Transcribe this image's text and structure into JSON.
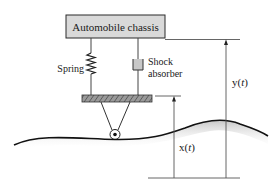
{
  "diagram": {
    "chassis_label": "Automobile chassis",
    "spring_label": "Spring",
    "shock_label_line1": "Shock",
    "shock_label_line2": "absorber",
    "y_label_prefix": "y(",
    "y_label_var": "t",
    "y_label_suffix": ")",
    "x_label_prefix": "x(",
    "x_label_var": "t",
    "x_label_suffix": ")"
  },
  "colors": {
    "chassis_fill": "#d9d9d9",
    "stroke": "#2a2a2a",
    "line": "#555555",
    "shock_fill": "#c8c8c8",
    "plate_fill": "#8a8a8a",
    "road_shadow": "#bdbdbd"
  }
}
